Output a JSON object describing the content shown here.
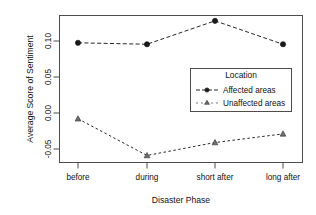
{
  "chart_data": {
    "type": "line",
    "title": "",
    "xlabel": "Disaster Phase",
    "ylabel": "Average Score of Sentiment",
    "categories": [
      "before",
      "during",
      "short after",
      "long after"
    ],
    "xtick_labels": [
      "before",
      "during",
      "short after",
      "long after"
    ],
    "ytick_labels": [
      "0.10",
      "0.05",
      "0.00",
      "-0.05"
    ],
    "ytick_values": [
      0.1,
      0.05,
      0.0,
      -0.05
    ],
    "ylim": [
      -0.072,
      0.134
    ],
    "xlim": [
      0.5,
      4.5
    ],
    "grid": false,
    "legend_position": "center-right",
    "series": [
      {
        "name": "Affected areas",
        "marker": "filled-circle",
        "linestyle": "dashed",
        "color": "#1a1a1a",
        "values": [
          0.0975,
          0.0955,
          0.128,
          0.0955
        ]
      },
      {
        "name": "Unaffected areas",
        "marker": "filled-triangle",
        "linestyle": "dashed",
        "color": "#6e6e6e",
        "values": [
          -0.008,
          -0.059,
          -0.041,
          -0.029
        ]
      }
    ]
  },
  "legend": {
    "title": "Location",
    "entries": [
      {
        "label": "Affected areas"
      },
      {
        "label": "Unaffected areas"
      }
    ]
  },
  "axes": {
    "x_title": "Disaster Phase",
    "y_title": "Average Score of Sentiment"
  }
}
